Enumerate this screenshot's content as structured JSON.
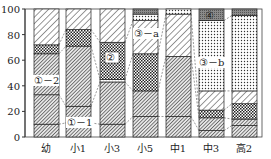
{
  "chart_data": {
    "type": "bar",
    "stacked": true,
    "title": "",
    "xlabel": "",
    "ylabel": "",
    "ylim": [
      0,
      100
    ],
    "yticks": [
      0,
      20,
      40,
      60,
      80,
      100
    ],
    "grid": false,
    "legend": "none (inline annotations)",
    "categories": [
      "幼",
      "小1",
      "小3",
      "小5",
      "中1",
      "中3",
      "高2"
    ],
    "segment_order_bottom_to_top": "each bar lists segments from 0% upward",
    "bars": [
      {
        "category": "幼",
        "segments": [
          {
            "pattern": "dense-hatch",
            "from": 0,
            "to": 10
          },
          {
            "pattern": "dense-hatch",
            "from": 10,
            "to": 33
          },
          {
            "pattern": "dense-hatch",
            "from": 33,
            "to": 65
          },
          {
            "pattern": "checker",
            "from": 65,
            "to": 72
          },
          {
            "pattern": "light-diagonal",
            "from": 72,
            "to": 100
          }
        ]
      },
      {
        "category": "小1",
        "segments": [
          {
            "pattern": "dense-hatch",
            "from": 0,
            "to": 11
          },
          {
            "pattern": "dense-hatch",
            "from": 11,
            "to": 24
          },
          {
            "pattern": "dense-hatch",
            "from": 24,
            "to": 71
          },
          {
            "pattern": "checker",
            "from": 71,
            "to": 84
          },
          {
            "pattern": "light-diagonal",
            "from": 84,
            "to": 100
          }
        ]
      },
      {
        "category": "小3",
        "segments": [
          {
            "pattern": "dense-hatch",
            "from": 0,
            "to": 10
          },
          {
            "pattern": "dense-hatch",
            "from": 10,
            "to": 43
          },
          {
            "pattern": "dots",
            "from": 43,
            "to": 45
          },
          {
            "pattern": "checker",
            "from": 45,
            "to": 74
          },
          {
            "pattern": "light-diagonal",
            "from": 74,
            "to": 100
          }
        ]
      },
      {
        "category": "小5",
        "segments": [
          {
            "pattern": "dense-hatch",
            "from": 0,
            "to": 16
          },
          {
            "pattern": "dense-hatch",
            "from": 16,
            "to": 36
          },
          {
            "pattern": "checker",
            "from": 36,
            "to": 65
          },
          {
            "pattern": "light-diagonal",
            "from": 65,
            "to": 91
          },
          {
            "pattern": "dots",
            "from": 91,
            "to": 96
          },
          {
            "pattern": "gray",
            "from": 96,
            "to": 100
          }
        ]
      },
      {
        "category": "中1",
        "segments": [
          {
            "pattern": "dense-hatch",
            "from": 0,
            "to": 16
          },
          {
            "pattern": "dense-hatch",
            "from": 16,
            "to": 63
          },
          {
            "pattern": "light-diagonal",
            "from": 63,
            "to": 96
          },
          {
            "pattern": "dots",
            "from": 96,
            "to": 100
          }
        ]
      },
      {
        "category": "中3",
        "segments": [
          {
            "pattern": "dense-hatch",
            "from": 0,
            "to": 5
          },
          {
            "pattern": "dense-hatch",
            "from": 5,
            "to": 15
          },
          {
            "pattern": "checker",
            "from": 15,
            "to": 21
          },
          {
            "pattern": "light-diagonal",
            "from": 21,
            "to": 36
          },
          {
            "pattern": "dots",
            "from": 36,
            "to": 91
          },
          {
            "pattern": "gray",
            "from": 91,
            "to": 100
          }
        ]
      },
      {
        "category": "高2",
        "segments": [
          {
            "pattern": "dense-hatch",
            "from": 0,
            "to": 9
          },
          {
            "pattern": "dense-hatch",
            "from": 9,
            "to": 14
          },
          {
            "pattern": "checker",
            "from": 14,
            "to": 26
          },
          {
            "pattern": "light-diagonal",
            "from": 26,
            "to": 36
          },
          {
            "pattern": "dots",
            "from": 36,
            "to": 95
          },
          {
            "pattern": "gray",
            "from": 95,
            "to": 100
          }
        ]
      }
    ],
    "annotations": [
      {
        "text": "①－2",
        "category": "幼",
        "y": 44
      },
      {
        "text": "①－1",
        "category": "小1",
        "y": 11
      },
      {
        "text": "②",
        "category": "小3",
        "y": 60
      },
      {
        "text": "③－a",
        "category": "小5",
        "y": 79
      },
      {
        "text": "③－b",
        "category": "中3",
        "y": 56
      },
      {
        "text": "④",
        "category": "中3",
        "y": 95
      }
    ]
  },
  "axis": {
    "ytick_labels": [
      "0",
      "20",
      "40",
      "60",
      "80",
      "100"
    ]
  },
  "categories": [
    "幼",
    "小1",
    "小3",
    "小5",
    "中1",
    "中3",
    "高2"
  ],
  "annotations": [
    "①－2",
    "①－1",
    "②",
    "③－a",
    "③－b",
    "④"
  ]
}
